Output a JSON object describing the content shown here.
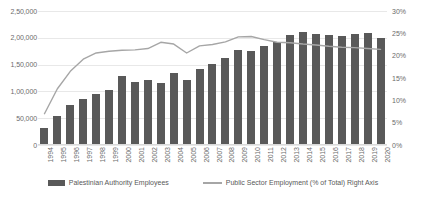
{
  "chart_data": {
    "type": "bar",
    "title": "",
    "subtitle": "",
    "xlabel": "",
    "ylabel": "",
    "ylabel_right": "",
    "categories": [
      "1994",
      "1995",
      "1996",
      "1997",
      "1998",
      "1999",
      "2000",
      "2001",
      "2002",
      "2003",
      "2004",
      "2005",
      "2006",
      "2007",
      "2008",
      "2009",
      "2010",
      "2011",
      "2012",
      "2013",
      "2014",
      "2015",
      "2016",
      "2017",
      "2018",
      "2019",
      "2020"
    ],
    "ylim": [
      0,
      250000
    ],
    "yticks": [
      "0",
      "50,000",
      "1,00,000",
      "1,50,000",
      "2,00,000",
      "2,50,000"
    ],
    "ytick_values": [
      0,
      50000,
      100000,
      150000,
      200000,
      250000
    ],
    "ylim_right": [
      0,
      30
    ],
    "yticks_right": [
      "0%",
      "5%",
      "10%",
      "15%",
      "20%",
      "25%",
      "30%"
    ],
    "ytick_values_right": [
      0,
      5,
      10,
      15,
      20,
      25,
      30
    ],
    "grid": true,
    "legend_position": "bottom",
    "series": [
      {
        "name": "Palestinian Authority Employees",
        "type": "bar",
        "axis": "left",
        "color": "#595959",
        "values": [
          32000,
          55000,
          74000,
          85000,
          95000,
          103000,
          128000,
          118000,
          121000,
          116000,
          134000,
          122000,
          141000,
          152000,
          163000,
          178000,
          176000,
          185000,
          193000,
          205000,
          210000,
          208000,
          206000,
          203000,
          207000,
          209000,
          200000
        ]
      },
      {
        "name": "Public Sector Employment (% of Total) Right Axis",
        "type": "line",
        "axis": "right",
        "color": "#a6a6a6",
        "values": [
          7.0,
          12.6,
          16.5,
          19.2,
          20.6,
          21.0,
          21.2,
          21.3,
          21.6,
          23.0,
          22.6,
          20.6,
          22.2,
          22.5,
          23.1,
          24.2,
          24.3,
          23.6,
          23.0,
          22.9,
          22.6,
          22.4,
          22.1,
          21.9,
          21.8,
          21.6,
          21.4
        ]
      }
    ]
  },
  "legend": {
    "bar_label": "Palestinian Authority Employees",
    "line_label": "Public Sector Employment (% of Total) Right Axis"
  }
}
